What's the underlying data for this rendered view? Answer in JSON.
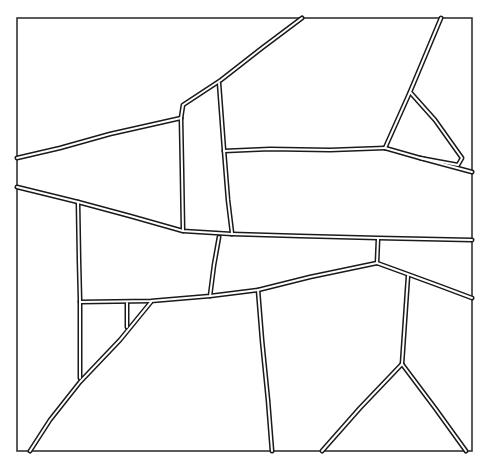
{
  "diagram": {
    "type": "polygonal-partition-line-drawing",
    "frame": {
      "x": 17,
      "y": 18,
      "width": 455,
      "height": 433
    },
    "colors": {
      "line": "#1a1a1a",
      "fill": "#ffffff",
      "frame": "#333333"
    },
    "edges": [
      {
        "name": "upper-left-diagonal",
        "points": [
          [
            302,
            18
          ],
          [
            262,
            48
          ],
          [
            221,
            80
          ],
          [
            183,
            105
          ],
          [
            181,
            118
          ]
        ]
      },
      {
        "name": "left-upper-wedge",
        "points": [
          [
            17,
            158
          ],
          [
            60,
            148
          ],
          [
            110,
            134
          ],
          [
            150,
            125
          ],
          [
            181,
            118
          ]
        ]
      },
      {
        "name": "left-vertical-a",
        "points": [
          [
            181,
            118
          ],
          [
            182,
            170
          ],
          [
            183,
            231
          ]
        ]
      },
      {
        "name": "left-vertical-b",
        "points": [
          [
            219,
            83
          ],
          [
            224,
            150
          ],
          [
            228,
            200
          ],
          [
            232,
            233
          ]
        ]
      },
      {
        "name": "middle-horizontal",
        "points": [
          [
            224,
            151
          ],
          [
            270,
            149
          ],
          [
            330,
            150
          ],
          [
            385,
            148
          ]
        ]
      },
      {
        "name": "right-horizontal",
        "points": [
          [
            385,
            148
          ],
          [
            420,
            158
          ],
          [
            472,
            172
          ]
        ]
      },
      {
        "name": "right-diagonal",
        "points": [
          [
            385,
            148
          ],
          [
            410,
            92
          ],
          [
            441,
            18
          ]
        ]
      },
      {
        "name": "right-triangle",
        "points": [
          [
            410,
            92
          ],
          [
            435,
            120
          ],
          [
            462,
            158
          ],
          [
            458,
            165
          ],
          [
            420,
            158
          ]
        ]
      },
      {
        "name": "lower-left-wedge",
        "points": [
          [
            17,
            187
          ],
          [
            78,
            202
          ],
          [
            130,
            216
          ],
          [
            183,
            231
          ],
          [
            232,
            234
          ]
        ]
      },
      {
        "name": "long-horizontal",
        "points": [
          [
            232,
            234
          ],
          [
            300,
            236
          ],
          [
            378,
            238
          ],
          [
            472,
            240
          ]
        ]
      },
      {
        "name": "left-column",
        "points": [
          [
            78,
            202
          ],
          [
            79,
            260
          ],
          [
            80,
            300
          ],
          [
            80,
            378
          ]
        ]
      },
      {
        "name": "center-short-vertical",
        "points": [
          [
            219,
            237
          ],
          [
            214,
            265
          ],
          [
            210,
            296
          ]
        ]
      },
      {
        "name": "lower-middle-arc",
        "points": [
          [
            80,
            302
          ],
          [
            151,
            301
          ],
          [
            210,
            296
          ],
          [
            258,
            290
          ],
          [
            310,
            277
          ],
          [
            377,
            263
          ]
        ]
      },
      {
        "name": "right-short-vertical",
        "points": [
          [
            378,
            239
          ],
          [
            377,
            263
          ]
        ]
      },
      {
        "name": "lower-right-arc",
        "points": [
          [
            377,
            263
          ],
          [
            410,
            275
          ],
          [
            440,
            286
          ],
          [
            472,
            298
          ]
        ]
      },
      {
        "name": "center-lower-vertical",
        "points": [
          [
            258,
            290
          ],
          [
            262,
            340
          ],
          [
            268,
            400
          ],
          [
            272,
            451
          ]
        ]
      },
      {
        "name": "right-lower-vertical",
        "points": [
          [
            408,
            276
          ],
          [
            405,
            320
          ],
          [
            402,
            364
          ]
        ]
      },
      {
        "name": "bottom-left-fork",
        "points": [
          [
            402,
            364
          ],
          [
            360,
            408
          ],
          [
            322,
            451
          ]
        ]
      },
      {
        "name": "bottom-right-fork",
        "points": [
          [
            402,
            364
          ],
          [
            435,
            408
          ],
          [
            466,
            451
          ]
        ]
      },
      {
        "name": "lower-left-diagonal",
        "points": [
          [
            151,
            302
          ],
          [
            120,
            340
          ],
          [
            80,
            382
          ],
          [
            50,
            420
          ],
          [
            30,
            451
          ]
        ]
      },
      {
        "name": "small-vertical",
        "points": [
          [
            127,
            303
          ],
          [
            127,
            327
          ]
        ]
      }
    ]
  }
}
